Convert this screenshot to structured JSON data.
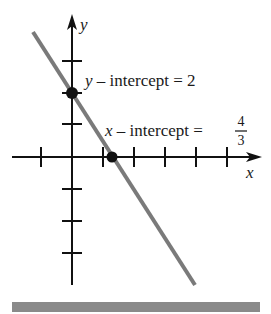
{
  "diagram": {
    "type": "line-graph-intercepts",
    "axes": {
      "x_label": "x",
      "y_label": "y",
      "x_ticks": [
        -1,
        1,
        2,
        3,
        4,
        5
      ],
      "y_ticks": [
        3,
        2,
        1,
        -1,
        -2,
        -3
      ]
    },
    "line": {
      "equation": "y = -3/2 x + 2",
      "color": "#7a7a7a"
    },
    "points": [
      {
        "name": "y-intercept",
        "x": 0,
        "y": 2
      },
      {
        "name": "x-intercept",
        "x": 1.3333,
        "y": 0
      }
    ],
    "annotations": {
      "y_intercept": {
        "var": "y",
        "text": " – intercept = ",
        "value": "2"
      },
      "x_intercept": {
        "var": "x",
        "text": " – intercept = ",
        "numerator": "4",
        "denominator": "3"
      }
    },
    "footer_bar_color": "#8a8a8a"
  }
}
